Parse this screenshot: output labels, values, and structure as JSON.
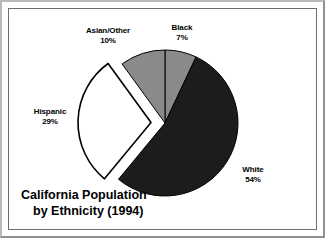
{
  "chart_data": {
    "type": "pie",
    "title": "California Population by Ethnicity (1994)",
    "title_line1": "California Population",
    "title_line2": "by Ethnicity (1994)",
    "xlabel": "",
    "ylabel": "",
    "legend": "none",
    "grid": false,
    "start_angle_deg": 0,
    "direction": "clockwise",
    "categories": [
      "Black",
      "White",
      "Hispanic",
      "Asian/Other"
    ],
    "values": [
      7,
      54,
      29,
      10
    ],
    "value_suffix": "%",
    "slices": [
      {
        "label": "Black",
        "percent_text": "7%",
        "value": 7,
        "color": "#8a8a8a",
        "stroke": "#000000",
        "exploded": false,
        "start_deg": 0,
        "end_deg": 25.2
      },
      {
        "label": "White",
        "percent_text": "54%",
        "value": 54,
        "color": "#1c1c1c",
        "stroke": "#000000",
        "exploded": false,
        "start_deg": 25.2,
        "end_deg": 219.6
      },
      {
        "label": "Hispanic",
        "percent_text": "29%",
        "value": 29,
        "color": "#ffffff",
        "stroke": "#000000",
        "exploded": true,
        "start_deg": 219.6,
        "end_deg": 324.0
      },
      {
        "label": "Asian/Other",
        "percent_text": "10%",
        "value": 10,
        "color": "#8a8a8a",
        "stroke": "#000000",
        "exploded": false,
        "start_deg": 324.0,
        "end_deg": 360.0
      }
    ]
  },
  "labels": {
    "asian_other": {
      "name": "Asian/Other",
      "percent": "10%"
    },
    "black": {
      "name": "Black",
      "percent": "7%"
    },
    "hispanic": {
      "name": "Hispanic",
      "percent": "29%"
    },
    "white": {
      "name": "White",
      "percent": "54%"
    }
  },
  "title": {
    "line1": "California Population",
    "line2": "by Ethnicity (1994)"
  },
  "colors": {
    "slice_gray": "#8a8a8a",
    "slice_dark": "#1c1c1c",
    "slice_white": "#ffffff",
    "outline": "#000000",
    "frame": "#6e6e6e",
    "background": "#ffffff"
  }
}
